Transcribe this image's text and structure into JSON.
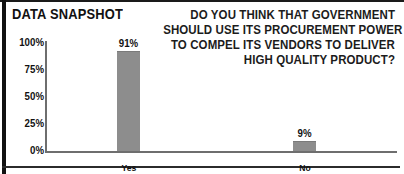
{
  "panel": {
    "title": "DATA SNAPSHOT",
    "frame_color": "#111111",
    "background": "#ffffff"
  },
  "question": {
    "lines": [
      "DO YOU THINK THAT GOVERNMENT",
      "SHOULD USE ITS PROCUREMENT POWER",
      "TO COMPEL ITS VENDORS TO DELIVER",
      "HIGH QUALITY PRODUCT?"
    ]
  },
  "chart_data": {
    "type": "bar",
    "title": "DATA SNAPSHOT",
    "subtitle": "DO YOU THINK THAT GOVERNMENT SHOULD USE ITS PROCUREMENT POWER TO COMPEL ITS VENDORS TO DELIVER HIGH QUALITY PRODUCT?",
    "categories": [
      "Yes",
      "No"
    ],
    "values": [
      91,
      9
    ],
    "value_labels": [
      "91%",
      "9%"
    ],
    "xlabel": "",
    "ylabel": "",
    "ylim": [
      0,
      100
    ],
    "yticks": [
      100,
      75,
      50,
      25,
      0
    ],
    "ytick_labels": [
      "100%",
      "75%",
      "50%",
      "25%",
      "0%"
    ],
    "grid": false,
    "legend": "none",
    "bar_color": "#8d8d8d",
    "axis_color": "#6e6e6e"
  }
}
